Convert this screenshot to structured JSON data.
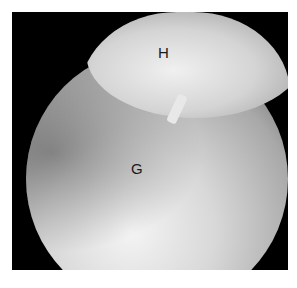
{
  "image": {
    "description": "Grayscale arthroscopic view of a joint showing two labeled structures within a circular endoscope field on a black background",
    "labels": {
      "upper": "H",
      "lower": "G"
    },
    "colors": {
      "background": "#ffffff",
      "frame": "#000000",
      "label": "#1a1a1a"
    }
  }
}
